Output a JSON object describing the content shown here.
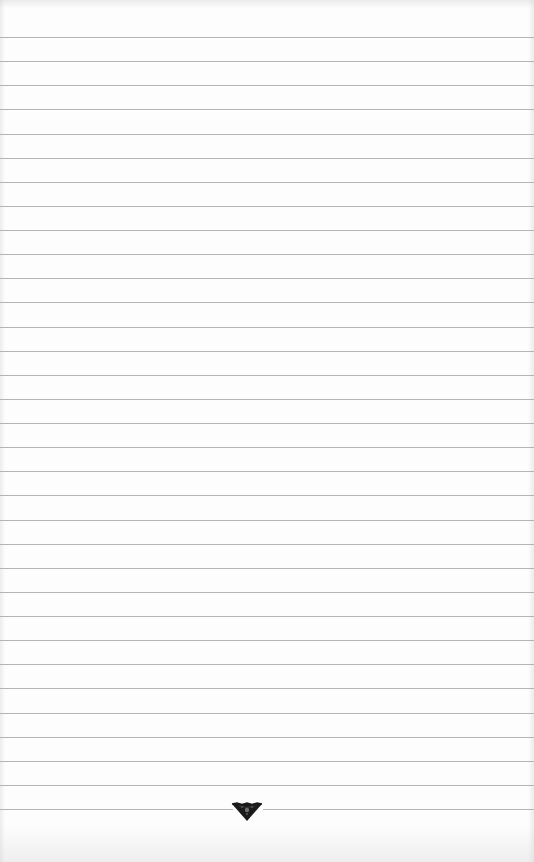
{
  "page": {
    "type": "lined-paper",
    "width": 534,
    "height": 862,
    "background_color": "#fdfdfd"
  },
  "rules": {
    "count": 33,
    "first_y": 37,
    "spacing": 24.125,
    "color": "#b4b4b4"
  },
  "ornament": {
    "icon": "triangle-ornament-icon",
    "color": "#1a1a1a",
    "center_x": 247,
    "line_index": 32
  }
}
